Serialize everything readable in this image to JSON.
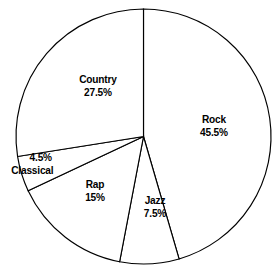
{
  "chart_data": {
    "type": "pie",
    "title": "",
    "subtitle": "",
    "xlabel": "",
    "ylabel": "",
    "legend": "none",
    "grid": false,
    "start_angle_deg": 0,
    "direction": "clockwise",
    "units": "percent",
    "categories": [
      "Rock",
      "Jazz",
      "Rap",
      "Classical",
      "Country"
    ],
    "values": [
      45.5,
      7.5,
      15,
      4.5,
      27.5
    ],
    "slices": [
      {
        "label": "Rock",
        "value": 45.5,
        "value_text": "45.5%",
        "start_deg": 0,
        "end_deg": 163.8
      },
      {
        "label": "Jazz",
        "value": 7.5,
        "value_text": "7.5%",
        "start_deg": 163.8,
        "end_deg": 190.8
      },
      {
        "label": "Rap",
        "value": 15,
        "value_text": "15%",
        "start_deg": 190.8,
        "end_deg": 244.8
      },
      {
        "label": "Classical",
        "value": 4.5,
        "value_text": "4.5%",
        "start_deg": 244.8,
        "end_deg": 261.0
      },
      {
        "label": "Country",
        "value": 27.5,
        "value_text": "27.5%",
        "start_deg": 261.0,
        "end_deg": 360.0
      }
    ],
    "total": 100,
    "colors": {
      "slice_fill": "#ffffff",
      "slice_stroke": "#000000",
      "background": "#ffffff",
      "label_text": "#000000"
    }
  },
  "labels": {
    "rock": {
      "name": "Rock",
      "pct": "45.5%"
    },
    "jazz": {
      "name": "Jazz",
      "pct": "7.5%"
    },
    "rap": {
      "name": "Rap",
      "pct": "15%"
    },
    "classical": {
      "name": "Classical",
      "pct": "4.5%"
    },
    "country": {
      "name": "Country",
      "pct": "27.5%"
    }
  }
}
